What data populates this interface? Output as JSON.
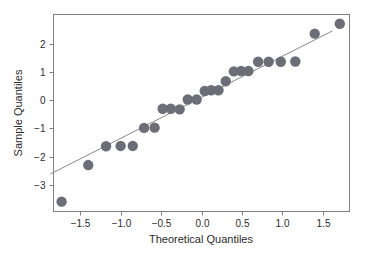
{
  "chart_data": {
    "type": "scatter",
    "title": "",
    "xlabel": "Theoretical Quantiles",
    "ylabel": "Sample Quantiles",
    "xlim": [
      -1.83,
      1.83
    ],
    "ylim": [
      -3.95,
      3.05
    ],
    "xticks": [
      -1.5,
      -1.0,
      -0.5,
      0.0,
      0.5,
      1.0,
      1.5
    ],
    "xticklabels": [
      "-1.5",
      "-1.0",
      "-0.5",
      "0.0",
      "0.5",
      "1.0",
      "1.5"
    ],
    "yticks": [
      2,
      1,
      0,
      -1,
      -2,
      -3
    ],
    "yticklabels": [
      "2",
      "1",
      "0",
      "-1",
      "-2",
      "-3"
    ],
    "grid": false,
    "legend": null,
    "marker_color": "#6d6d78",
    "marker_size": 5.2,
    "line_color": "#8a8a8a",
    "frame_color": "#808080",
    "background_color": "#ffffff",
    "reference_line": {
      "name": "qq-reference-line",
      "x": [
        -1.87,
        1.62
      ],
      "y": [
        -2.62,
        2.47
      ]
    },
    "x": [
      -1.73,
      -1.4,
      -1.18,
      -1.0,
      -0.85,
      -0.71,
      -0.58,
      -0.48,
      -0.38,
      -0.27,
      -0.17,
      -0.06,
      0.04,
      0.12,
      0.21,
      0.3,
      0.4,
      0.49,
      0.58,
      0.7,
      0.83,
      0.98,
      1.16,
      1.4,
      1.71
    ],
    "y": [
      -3.6,
      -2.3,
      -1.63,
      -1.62,
      -1.62,
      -0.98,
      -0.97,
      -0.3,
      -0.3,
      -0.32,
      0.03,
      0.03,
      0.33,
      0.36,
      0.36,
      0.68,
      1.03,
      1.04,
      1.04,
      1.37,
      1.37,
      1.37,
      1.38,
      2.37,
      2.72
    ],
    "points": [
      {
        "x": -1.73,
        "y": -3.6
      },
      {
        "x": -1.4,
        "y": -2.3
      },
      {
        "x": -1.18,
        "y": -1.63
      },
      {
        "x": -1.0,
        "y": -1.62
      },
      {
        "x": -0.85,
        "y": -1.62
      },
      {
        "x": -0.71,
        "y": -0.98
      },
      {
        "x": -0.58,
        "y": -0.97
      },
      {
        "x": -0.48,
        "y": -0.3
      },
      {
        "x": -0.38,
        "y": -0.3
      },
      {
        "x": -0.27,
        "y": -0.32
      },
      {
        "x": -0.17,
        "y": 0.03
      },
      {
        "x": -0.06,
        "y": 0.03
      },
      {
        "x": 0.04,
        "y": 0.33
      },
      {
        "x": 0.12,
        "y": 0.36
      },
      {
        "x": 0.21,
        "y": 0.36
      },
      {
        "x": 0.3,
        "y": 0.68
      },
      {
        "x": 0.4,
        "y": 1.03
      },
      {
        "x": 0.49,
        "y": 1.04
      },
      {
        "x": 0.58,
        "y": 1.04
      },
      {
        "x": 0.7,
        "y": 1.37
      },
      {
        "x": 0.83,
        "y": 1.37
      },
      {
        "x": 0.98,
        "y": 1.37
      },
      {
        "x": 1.16,
        "y": 1.38
      },
      {
        "x": 1.4,
        "y": 2.37
      },
      {
        "x": 1.71,
        "y": 2.72
      }
    ]
  }
}
